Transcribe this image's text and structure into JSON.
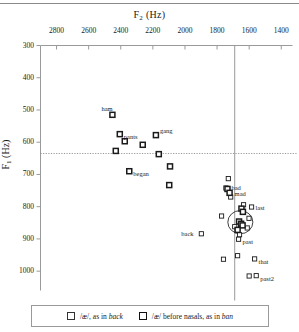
{
  "figure": {
    "x_axis_title": "F",
    "x_axis_sub": "2",
    "x_axis_unit": " (Hz)",
    "y_axis_title": "F",
    "y_axis_sub": "1",
    "y_axis_unit": " (Hz)"
  },
  "legend": {
    "item1_pre": "/æ/, as in ",
    "item1_word": "back",
    "item2_pre": "/æ/ before nasals, as in ",
    "item2_word": "ban"
  },
  "chart_data": {
    "type": "scatter",
    "title": "",
    "xlabel": "F2 (Hz)",
    "ylabel": "F1 (Hz)",
    "xlim": [
      2900,
      1330
    ],
    "ylim": [
      1060,
      300
    ],
    "x_reversed": true,
    "y_reversed": true,
    "grid": false,
    "xticks": [
      2800,
      2600,
      2400,
      2200,
      2000,
      1800,
      1600,
      1400
    ],
    "yticks": [
      300,
      400,
      500,
      600,
      700,
      800,
      900,
      1000
    ],
    "legend_position": "below-plot",
    "reference_lines": [
      {
        "orientation": "horizontal",
        "value": 635,
        "style": "dotted"
      },
      {
        "orientation": "vertical",
        "value": 1690,
        "style": "solid"
      }
    ],
    "annotation_ellipse": {
      "cx_f2": 1655,
      "cy_f1": 848,
      "rx_hz": 78,
      "ry_hz": 36
    },
    "series": [
      {
        "name": "/æ/, as in back",
        "marker": "open-square-thin",
        "points": [
          {
            "f2": 1730,
            "f1": 713,
            "label": null
          },
          {
            "f2": 1745,
            "f1": 742,
            "label": null
          },
          {
            "f2": 1715,
            "f1": 770,
            "label": null
          },
          {
            "f2": 1635,
            "f1": 794,
            "label": null
          },
          {
            "f2": 1585,
            "f1": 801,
            "label": "last"
          },
          {
            "f2": 1772,
            "f1": 829,
            "label": null
          },
          {
            "f2": 1601,
            "f1": 836,
            "label": null
          },
          {
            "f2": 1690,
            "f1": 862,
            "label": null
          },
          {
            "f2": 1612,
            "f1": 866,
            "label": null
          },
          {
            "f2": 1660,
            "f1": 887,
            "label": null
          },
          {
            "f2": 1666,
            "f1": 901,
            "label": "past"
          },
          {
            "f2": 1898,
            "f1": 884,
            "label": "back"
          },
          {
            "f2": 1760,
            "f1": 963,
            "label": null
          },
          {
            "f2": 1672,
            "f1": 952,
            "label": null
          },
          {
            "f2": 1566,
            "f1": 962,
            "label": "that"
          },
          {
            "f2": 1600,
            "f1": 1015,
            "label": null
          },
          {
            "f2": 1556,
            "f1": 1014,
            "label": "past2"
          }
        ]
      },
      {
        "name": "/æ/ before nasals, as in ban",
        "marker": "open-square-thick",
        "points": [
          {
            "f2": 2452,
            "f1": 515,
            "label": "ham"
          },
          {
            "f2": 2406,
            "f1": 575,
            "label": "pants"
          },
          {
            "f2": 2181,
            "f1": 578,
            "label": "gang"
          },
          {
            "f2": 2375,
            "f1": 597,
            "label": null
          },
          {
            "f2": 2263,
            "f1": 608,
            "label": null
          },
          {
            "f2": 2431,
            "f1": 627,
            "label": null
          },
          {
            "f2": 2163,
            "f1": 637,
            "label": null
          },
          {
            "f2": 2347,
            "f1": 690,
            "label": "began"
          },
          {
            "f2": 2093,
            "f1": 675,
            "label": null
          },
          {
            "f2": 2098,
            "f1": 733,
            "label": null
          },
          {
            "f2": 1735,
            "f1": 745,
            "label": "bad"
          },
          {
            "f2": 1722,
            "f1": 757,
            "label": "mad"
          },
          {
            "f2": 1648,
            "f1": 806,
            "label": null
          },
          {
            "f2": 1639,
            "f1": 816,
            "label": null
          },
          {
            "f2": 1663,
            "f1": 846,
            "label": null
          },
          {
            "f2": 1650,
            "f1": 853,
            "label": null
          },
          {
            "f2": 1641,
            "f1": 858,
            "label": null
          },
          {
            "f2": 1672,
            "f1": 872,
            "label": null
          }
        ]
      }
    ]
  }
}
